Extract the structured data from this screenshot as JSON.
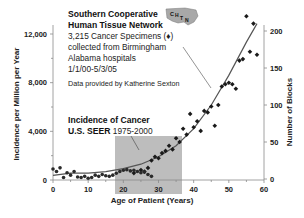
{
  "chart_data": {
    "type": "scatter",
    "title": "Southern Cooperative Human Tissue Network",
    "xlabel": "Age of Patient (Years)",
    "ylabel_left": "Incidence per Million per Year",
    "ylabel_right": "Number of Blocks",
    "x_ticks": [
      "0",
      "10",
      "20",
      "30",
      "40",
      "50",
      "60"
    ],
    "y_left_ticks": [
      "0",
      "4,000",
      "8,000",
      "12,000"
    ],
    "y_right_ticks": [
      "0",
      "50",
      "100",
      "150",
      "200"
    ],
    "xlim": [
      0,
      60
    ],
    "ylim_left": [
      0,
      14000
    ],
    "ylim_right": [
      0,
      225
    ],
    "grid": false,
    "legend": "annotations",
    "series": [
      {
        "name": "CHTN Cancer Specimens (blocks)",
        "axis": "right",
        "marker": "diamond",
        "x": [
          23,
          25,
          26,
          27,
          28,
          29,
          30,
          31,
          32,
          33,
          34,
          35,
          36,
          37,
          38,
          39,
          40,
          41,
          42,
          43,
          44,
          45,
          46,
          47,
          48,
          49,
          50,
          51,
          52,
          53,
          54,
          55,
          56,
          57,
          58
        ],
        "y": [
          8,
          12,
          10,
          15,
          25,
          30,
          28,
          35,
          38,
          45,
          40,
          55,
          50,
          68,
          60,
          88,
          70,
          78,
          65,
          92,
          90,
          98,
          72,
          100,
          125,
          128,
          130,
          128,
          122,
          160,
          162,
          220,
          172,
          210,
          168
        ]
      },
      {
        "name": "Incidence of Cancer U.S. SEER 1975-2000",
        "axis": "left",
        "marker": "circle",
        "x": [
          0,
          1,
          2,
          3,
          4,
          5,
          6,
          7,
          8,
          9,
          10,
          11,
          12,
          13,
          14,
          15,
          16,
          17,
          18,
          19,
          20,
          21,
          22,
          23,
          24,
          25,
          26,
          27,
          28
        ],
        "y": [
          900,
          700,
          1000,
          200,
          600,
          400,
          700,
          250,
          200,
          300,
          150,
          200,
          400,
          300,
          450,
          350,
          300,
          400,
          550,
          700,
          800,
          850,
          750,
          800,
          700,
          600,
          650,
          450,
          300
        ]
      },
      {
        "name": "Fitted trend",
        "type": "line",
        "axis": "right",
        "x": [
          0,
          5,
          10,
          15,
          20,
          25,
          30,
          35,
          40,
          45,
          50,
          55,
          58
        ],
        "y": [
          5,
          8,
          8,
          10,
          14,
          20,
          30,
          45,
          68,
          100,
          140,
          185,
          210
        ]
      }
    ],
    "annotations": [
      "Southern Cooperative",
      "Human Tissue Network",
      "3,215 Cancer Specimens (♦)",
      "collected from Birmingham",
      "Alabama hospitals",
      "1/1/00-5/3/05",
      "Data provided by Katherine Sexton",
      "Incidence of Cancer",
      "U.S. SEER 1975-2000"
    ],
    "highlight_region": {
      "x": [
        18,
        37
      ],
      "note": "gray shaded box for SEER ages"
    }
  },
  "labels": {
    "org_line1": "Southern Cooperative",
    "org_line2": "Human Tissue Network",
    "specimens": "3,215 Cancer Specimens (♦)",
    "collected": "collected from Birmingham",
    "hospitals": "Alabama hospitals",
    "dates": "1/1/00-5/3/05",
    "provided_by": "Data provided by Katherine Sexton",
    "seer_line1": "Incidence of Cancer",
    "seer_line2_bold": "U.S. SEER",
    "seer_line2_years": " 1975-2000",
    "logo_text": "CHTN",
    "xlabel": "Age of Patient (Years)",
    "ylabel_left": "Incidence per Million per Year",
    "ylabel_right": "Number of Blocks"
  },
  "colors": {
    "shade": "#b9b9b9",
    "marker": "#1a1a1a",
    "line": "#555555",
    "axis": "#888888",
    "logo": "#9a9a9a"
  }
}
